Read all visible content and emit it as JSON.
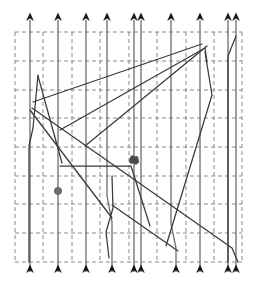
{
  "figure": {
    "title": "",
    "background_color": "#ffffff",
    "width": 254,
    "height": 291
  },
  "chart_data": {
    "type": "line",
    "title": "",
    "subtitle": "",
    "xlabel": "",
    "ylabel": "",
    "xlim": [
      15,
      242
    ],
    "ylim": [
      32,
      262
    ],
    "grid": true,
    "grid_style": "dashed",
    "grid_color": "#7d7d7d",
    "legend": "none",
    "annotations": [
      {
        "name": "gray-dot-marker",
        "shape": "circle",
        "x": 58,
        "y": 191,
        "radius": 3.6,
        "color": "#6e6e6e"
      },
      {
        "name": "cluster-marker",
        "shape": "blob",
        "x": 134,
        "y": 160,
        "radius": 4.0,
        "color": "#4a4a4a"
      }
    ],
    "grid_lines": {
      "vertical_x": [
        15,
        43,
        72,
        100,
        129,
        157,
        186,
        214,
        242
      ],
      "horizontal_y": [
        32,
        61,
        90,
        118,
        147,
        176,
        204,
        233,
        262
      ]
    },
    "axis_box": {
      "x0": 15,
      "y0": 32,
      "x1": 242,
      "y1": 262
    },
    "arrow_color": "#111111",
    "trajectory_color": "#6d6d6d",
    "diagonal_color": "#3a3a3a",
    "series": [
      {
        "name": "trajectory-1",
        "kind": "vertical-trajectory",
        "arrow_top_x": 30,
        "arrow_bottom_x": 30,
        "points": [
          [
            30,
            20
          ],
          [
            30,
            272
          ]
        ]
      },
      {
        "name": "trajectory-2",
        "kind": "vertical-trajectory",
        "arrow_top_x": 58,
        "arrow_bottom_x": 58,
        "points": [
          [
            58,
            20
          ],
          [
            58,
            272
          ]
        ]
      },
      {
        "name": "trajectory-3",
        "kind": "vertical-trajectory",
        "arrow_top_x": 86,
        "arrow_bottom_x": 86,
        "points": [
          [
            86,
            20
          ],
          [
            86,
            272
          ]
        ]
      },
      {
        "name": "trajectory-4",
        "kind": "vertical-trajectory",
        "arrow_top_x": 107,
        "arrow_bottom_x": 112,
        "points": [
          [
            107,
            20
          ],
          [
            107,
            196
          ],
          [
            112,
            222
          ],
          [
            112,
            272
          ]
        ]
      },
      {
        "name": "trajectory-5",
        "kind": "vertical-trajectory",
        "arrow_top_x": 134,
        "arrow_bottom_x": 134,
        "points": [
          [
            134,
            20
          ],
          [
            134,
            272
          ]
        ]
      },
      {
        "name": "trajectory-6",
        "kind": "vertical-trajectory",
        "arrow_top_x": 141,
        "arrow_bottom_x": 141,
        "points": [
          [
            141,
            20
          ],
          [
            141,
            272
          ]
        ]
      },
      {
        "name": "trajectory-7",
        "kind": "vertical-trajectory",
        "arrow_top_x": 171,
        "arrow_bottom_x": 176,
        "points": [
          [
            171,
            20
          ],
          [
            171,
            224
          ],
          [
            176,
            248
          ],
          [
            176,
            272
          ]
        ]
      },
      {
        "name": "trajectory-8",
        "kind": "vertical-trajectory",
        "arrow_top_x": 200,
        "arrow_bottom_x": 200,
        "points": [
          [
            200,
            20
          ],
          [
            200,
            272
          ]
        ]
      },
      {
        "name": "trajectory-9",
        "kind": "vertical-trajectory",
        "arrow_top_x": 228,
        "arrow_bottom_x": 228,
        "points": [
          [
            228,
            20
          ],
          [
            228,
            272
          ]
        ]
      },
      {
        "name": "trajectory-10",
        "kind": "vertical-trajectory",
        "arrow_top_x": 236,
        "arrow_bottom_x": 236,
        "points": [
          [
            236,
            20
          ],
          [
            236,
            272
          ]
        ]
      },
      {
        "name": "path-left-spike",
        "kind": "polyline",
        "points": [
          [
            38,
            75
          ],
          [
            33,
            128
          ],
          [
            29,
            146
          ],
          [
            29,
            262
          ]
        ]
      },
      {
        "name": "path-left-fan",
        "kind": "polyline",
        "points": [
          [
            38,
            76
          ],
          [
            62,
            163
          ]
        ]
      },
      {
        "name": "path-center-descend",
        "kind": "polyline",
        "points": [
          [
            30,
            110
          ],
          [
            112,
            218
          ]
        ]
      },
      {
        "name": "path-mid-wave",
        "kind": "polyline",
        "points": [
          [
            112,
            176
          ],
          [
            113,
            208
          ],
          [
            106,
            232
          ],
          [
            109,
            258
          ]
        ]
      },
      {
        "name": "path-long-diagonal-a",
        "kind": "polyline",
        "points": [
          [
            33,
            102
          ],
          [
            202,
            44
          ]
        ]
      },
      {
        "name": "path-long-diagonal-b",
        "kind": "polyline",
        "points": [
          [
            60,
            130
          ],
          [
            205,
            48
          ],
          [
            207,
            62
          ]
        ]
      },
      {
        "name": "path-long-diagonal-c",
        "kind": "polyline",
        "points": [
          [
            32,
            108
          ],
          [
            232,
            248
          ],
          [
            238,
            262
          ]
        ]
      },
      {
        "name": "path-long-diagonal-d",
        "kind": "polyline",
        "points": [
          [
            85,
            146
          ],
          [
            207,
            46
          ]
        ]
      },
      {
        "name": "path-long-diagonal-e",
        "kind": "polyline",
        "points": [
          [
            166,
            246
          ],
          [
            212,
            95
          ],
          [
            205,
            52
          ]
        ]
      },
      {
        "name": "path-long-diagonal-f",
        "kind": "polyline",
        "points": [
          [
            60,
            166
          ],
          [
            131,
            166
          ],
          [
            150,
            226
          ]
        ]
      },
      {
        "name": "path-right-bend",
        "kind": "polyline",
        "points": [
          [
            236,
            36
          ],
          [
            228,
            56
          ],
          [
            228,
            262
          ]
        ]
      },
      {
        "name": "path-steep-right",
        "kind": "polyline",
        "points": [
          [
            112,
            205
          ],
          [
            178,
            251
          ]
        ]
      }
    ]
  },
  "labels": {
    "caption": ""
  }
}
